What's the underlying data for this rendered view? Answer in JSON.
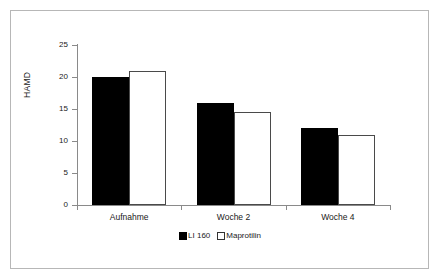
{
  "chart_data": {
    "type": "bar",
    "title": "",
    "xlabel": "",
    "ylabel": "HAMD",
    "ylim": [
      0,
      25
    ],
    "yticks": [
      0,
      5,
      10,
      15,
      20,
      25
    ],
    "ytick_labels": [
      "0",
      "5",
      "10",
      "15",
      "20",
      "25"
    ],
    "grid": false,
    "legend_position": "bottom-center",
    "categories": [
      "Aufnahme",
      "Woche 2",
      "Woche 4"
    ],
    "series": [
      {
        "name": "LI 160",
        "style": "filled",
        "color": "#000000",
        "values": [
          20,
          16,
          12
        ]
      },
      {
        "name": "Maprotilin",
        "style": "open",
        "color": "#ffffff",
        "values": [
          21,
          14.5,
          11
        ]
      }
    ]
  },
  "legend": {
    "entries": [
      {
        "label": "LI 160",
        "swatch": "filled-square-icon"
      },
      {
        "label": "Maprotilin",
        "swatch": "open-square-icon"
      }
    ]
  },
  "colors": {
    "frame": "#b7b7b7",
    "axis": "#8a8a8a",
    "text": "#1a1a1a",
    "series_filled": "#000000",
    "series_open": "#ffffff"
  }
}
